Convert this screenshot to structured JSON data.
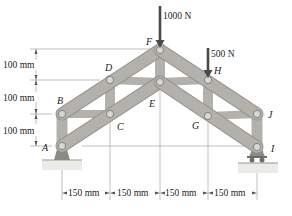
{
  "diagram": {
    "type": "pin-connected frame / truss structure",
    "colors": {
      "member_fill": "#b3b1ab",
      "member_edge": "#8f8d87",
      "pin_fill": "#d9d7d2",
      "support_fill": "#8c8a85",
      "ground_fill": "#e6e5e1",
      "dim_line": "#9a9a9a",
      "force_arrow": "#4a4a4a",
      "text": "#222222"
    },
    "joints": [
      {
        "id": "F",
        "label": "F",
        "x": 160,
        "y": 50
      },
      {
        "id": "D",
        "label": "D",
        "x": 110,
        "y": 80
      },
      {
        "id": "B",
        "label": "B",
        "x": 62,
        "y": 114
      },
      {
        "id": "A",
        "label": "A",
        "x": 62,
        "y": 146
      },
      {
        "id": "E",
        "label": "E",
        "x": 160,
        "y": 82
      },
      {
        "id": "C",
        "label": "C",
        "x": 110,
        "y": 114
      },
      {
        "id": "H",
        "label": "H",
        "x": 208,
        "y": 80
      },
      {
        "id": "J",
        "label": "J",
        "x": 257,
        "y": 114
      },
      {
        "id": "G",
        "label": "G",
        "x": 208,
        "y": 116
      },
      {
        "id": "I",
        "label": "I",
        "x": 257,
        "y": 147
      }
    ],
    "loads": [
      {
        "id": "load-F",
        "value": "1000 N",
        "at": "F"
      },
      {
        "id": "load-H",
        "value": "500 N",
        "at": "H"
      }
    ],
    "vertical_dimensions": [
      {
        "label": "100 mm",
        "span": "F–D level"
      },
      {
        "label": "100 mm",
        "span": "D–B level"
      },
      {
        "label": "100 mm",
        "span": "B–A level"
      }
    ],
    "horizontal_dimensions": [
      {
        "label": "150 mm"
      },
      {
        "label": "150 mm"
      },
      {
        "label": "150 mm"
      },
      {
        "label": "150 mm"
      }
    ],
    "supports": [
      {
        "at": "A",
        "type": "pin"
      },
      {
        "at": "I",
        "type": "roller"
      }
    ]
  }
}
